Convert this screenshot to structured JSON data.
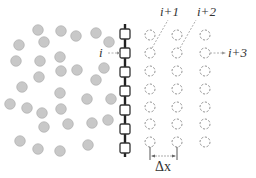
{
  "diagram": {
    "labels": {
      "i": "i",
      "i_plus_1": "i+1",
      "i_plus_2": "i+2",
      "i_plus_3": "i+3",
      "delta_x": "Δx"
    },
    "colors": {
      "particle_fill": "#c8c8c8",
      "particle_stroke": "#a8a8a8",
      "chain_line": "#222222",
      "chain_node_stroke": "#333333",
      "ghost_stroke": "#777777",
      "pointer": "#999999"
    },
    "particles": [
      [
        38,
        30
      ],
      [
        61,
        31
      ],
      [
        76,
        36
      ],
      [
        96,
        33
      ],
      [
        19,
        45
      ],
      [
        44,
        42
      ],
      [
        109,
        42
      ],
      [
        16,
        61
      ],
      [
        40,
        61
      ],
      [
        60,
        57
      ],
      [
        104,
        68
      ],
      [
        39,
        77
      ],
      [
        61,
        71
      ],
      [
        77,
        70
      ],
      [
        96,
        80
      ],
      [
        22,
        87
      ],
      [
        60,
        93
      ],
      [
        87,
        99
      ],
      [
        111,
        99
      ],
      [
        10,
        104
      ],
      [
        27,
        108
      ],
      [
        42,
        113
      ],
      [
        61,
        109
      ],
      [
        44,
        127
      ],
      [
        68,
        124
      ],
      [
        92,
        123
      ],
      [
        108,
        120
      ],
      [
        20,
        141
      ],
      [
        38,
        149
      ],
      [
        60,
        151
      ],
      [
        88,
        145
      ]
    ],
    "chain": {
      "x": 125,
      "y_top": 24,
      "y_bottom": 157,
      "nodes_y": [
        34,
        53,
        72,
        91,
        110,
        129,
        148
      ]
    },
    "ghost_columns_x": [
      150,
      177,
      205
    ],
    "ghost_rows_y": [
      35,
      53,
      71,
      89,
      107,
      124,
      142
    ]
  }
}
